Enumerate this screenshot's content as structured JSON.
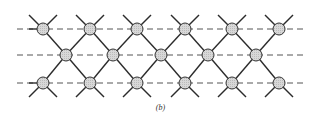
{
  "figure": {
    "caption": "(b)",
    "colors": {
      "bond": "#2b2b2b",
      "dash": "#555555",
      "node_fill": "#d4d4d4",
      "node_stroke": "#333333"
    },
    "dashed_lines": [
      {
        "y": 29,
        "x1": 17,
        "x2": 305
      },
      {
        "y": 55,
        "x1": 17,
        "x2": 305
      },
      {
        "y": 83,
        "x1": 17,
        "x2": 305
      }
    ],
    "node_radius": 6,
    "rows": [
      {
        "name": "top",
        "y": 29,
        "x": [
          43,
          90,
          137,
          185,
          232,
          279
        ]
      },
      {
        "name": "middle",
        "y": 55,
        "x": [
          66,
          113,
          161,
          208,
          256
        ]
      },
      {
        "name": "bottom",
        "y": 83,
        "x": [
          43,
          90,
          137,
          185,
          232,
          279
        ]
      }
    ],
    "stub_length": 14
  }
}
